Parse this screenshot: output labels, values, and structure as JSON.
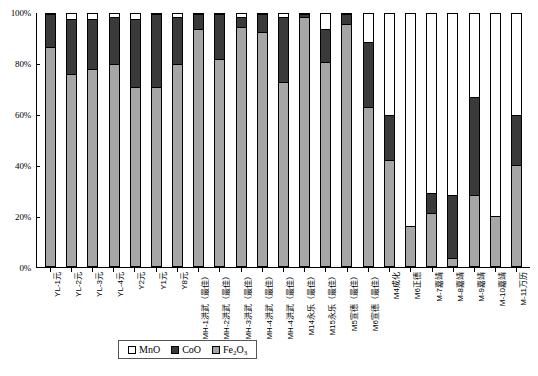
{
  "chart_data": {
    "type": "bar",
    "subtype": "stacked-100-percent",
    "title": "",
    "xlabel": "",
    "ylabel": "",
    "ylim": [
      0,
      100
    ],
    "ytick_labels": [
      "0%",
      "20%",
      "40%",
      "60%",
      "80%",
      "100%"
    ],
    "ytick_values": [
      0,
      20,
      40,
      60,
      80,
      100
    ],
    "grid": false,
    "legend_position": "bottom",
    "categories": [
      "YL-1元",
      "YL-2元",
      "YL-3元",
      "YL-4元",
      "Y2元",
      "Y1元",
      "Y8元",
      "MH-1洪武（最佳）",
      "MH-2洪武（最佳）",
      "MH-3洪武（最佳）",
      "MH-4洪武（最佳）",
      "MH-4洪武（最佳）",
      "M14永乐（最佳）",
      "M15永乐（最佳）",
      "M5宣德（最佳）",
      "M6宣德（最佳）",
      "M4成化",
      "M6正德",
      "M-7嘉靖",
      "M-8嘉靖",
      "M-9嘉靖",
      "M-10嘉靖",
      "M-11万历"
    ],
    "series": [
      {
        "name": "MnO",
        "color": "#ffffff",
        "values": [
          0,
          2,
          2,
          1,
          2,
          0,
          1,
          0,
          0,
          1,
          0,
          1,
          0,
          6,
          0,
          11,
          40,
          84,
          71,
          72,
          33,
          80,
          40
        ]
      },
      {
        "name": "CoO",
        "color": "#3a3a3a",
        "values": [
          13,
          22,
          20,
          19,
          27,
          29,
          19,
          6,
          18,
          4,
          7,
          26,
          1,
          13,
          4,
          26,
          18,
          0,
          8,
          25,
          39,
          0,
          20
        ]
      },
      {
        "name": "Fe2O3",
        "color": "#a6a6a6",
        "values": [
          87,
          76,
          78,
          80,
          71,
          71,
          80,
          94,
          82,
          95,
          93,
          73,
          99,
          81,
          96,
          63,
          42,
          16,
          21,
          3,
          28,
          20,
          40
        ]
      }
    ]
  },
  "legend": {
    "items": [
      {
        "label": "MnO",
        "label_sub": "",
        "label_tail": "",
        "swatch": "mno"
      },
      {
        "label": "CoO",
        "label_sub": "",
        "label_tail": "",
        "swatch": "coo"
      },
      {
        "label": "Fe",
        "label_sub": "2",
        "label_mid": "O",
        "label_tail": "3",
        "swatch": "fe"
      }
    ]
  },
  "icons": {
    "legend_swatch_mno": "white-square-icon",
    "legend_swatch_coo": "black-square-icon",
    "legend_swatch_fe": "gray-square-icon"
  }
}
